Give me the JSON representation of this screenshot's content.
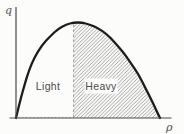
{
  "figure": {
    "y_axis_label": "q",
    "x_axis_label": "ρ",
    "region_labels": {
      "light": "Light",
      "heavy": "Heavy"
    }
  },
  "colors": {
    "background": "#fcfcfb",
    "curve": "#1c1c1c",
    "axis": "#4a4a4a",
    "hatch": "#8c8c8c",
    "divider": "#9a9a9a",
    "label_text": "#4a4a4a"
  },
  "chart_data": {
    "type": "area",
    "title": "",
    "xlabel": "ρ",
    "ylabel": "q",
    "x_range": [
      0,
      1
    ],
    "y_range": [
      0,
      1
    ],
    "grid": false,
    "legend": false,
    "axis_ticks": "none",
    "curve_points": [
      [
        0.0,
        0.0
      ],
      [
        0.03,
        0.19
      ],
      [
        0.06,
        0.35
      ],
      [
        0.09,
        0.5
      ],
      [
        0.13,
        0.64
      ],
      [
        0.18,
        0.76
      ],
      [
        0.24,
        0.86
      ],
      [
        0.29,
        0.93
      ],
      [
        0.35,
        0.98
      ],
      [
        0.4,
        1.0
      ],
      [
        0.46,
        1.0
      ],
      [
        0.51,
        0.98
      ],
      [
        0.57,
        0.94
      ],
      [
        0.63,
        0.88
      ],
      [
        0.68,
        0.8
      ],
      [
        0.74,
        0.7
      ],
      [
        0.79,
        0.59
      ],
      [
        0.85,
        0.46
      ],
      [
        0.9,
        0.31
      ],
      [
        0.95,
        0.16
      ],
      [
        1.0,
        0.0
      ]
    ],
    "divider_x": 0.4,
    "regions": [
      {
        "label": "Light",
        "x_start": 0.0,
        "x_end": 0.4,
        "fill": "none"
      },
      {
        "label": "Heavy",
        "x_start": 0.4,
        "x_end": 1.0,
        "fill": "diagonal-hatch"
      }
    ]
  }
}
